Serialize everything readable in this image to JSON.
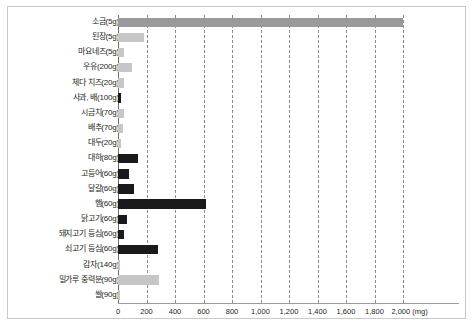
{
  "chart_data": {
    "type": "bar",
    "orientation": "horizontal",
    "title": "",
    "subtitle": "",
    "xlabel": "(mg)",
    "ylabel": "",
    "unit": "mg",
    "xlim": [
      0,
      2000
    ],
    "grid": true,
    "legend": false,
    "x_ticks": [
      "0",
      "200",
      "400",
      "600",
      "800",
      "1,000",
      "1,200",
      "1,400",
      "1,600",
      "1,800",
      "2,000"
    ],
    "x_axis_unit_label": "2,000 (mg)",
    "categories": [
      "소금(5g)",
      "된장(5g)",
      "마요네즈(5g)",
      "우유(200g)",
      "체다 치즈(20g)",
      "사과, 배(100g)",
      "시금치(70g)",
      "배추(70g)",
      "대두(20g)",
      "대하(80g)",
      "고등어(60g)",
      "달걀(60g)",
      "햄(60g)",
      "닭고기(60g)",
      "돼지고기 등심(60g)",
      "쇠고기 등심(60g)",
      "감자(140g)",
      "밀가루 중력분(90g)",
      "쌀(90g)"
    ],
    "values": [
      2000,
      180,
      40,
      100,
      40,
      18,
      45,
      35,
      18,
      140,
      75,
      110,
      620,
      65,
      40,
      280,
      10,
      290,
      8
    ],
    "bar_styles": [
      "mid",
      "light",
      "light",
      "light",
      "light",
      "dark",
      "light",
      "light",
      "light",
      "dark",
      "dark",
      "dark",
      "dark",
      "dark",
      "dark",
      "dark",
      "light",
      "light",
      "light"
    ],
    "colors": {
      "light_bar": "#c6c6c6",
      "mid_bar": "#9a9a9a",
      "dark_bar": "#1a1a1a",
      "axis": "#6d6d6d",
      "gridline": "#8c8c8c",
      "text": "#231f20",
      "frame_border": "#c9c9c9",
      "background": "#ffffff"
    }
  }
}
